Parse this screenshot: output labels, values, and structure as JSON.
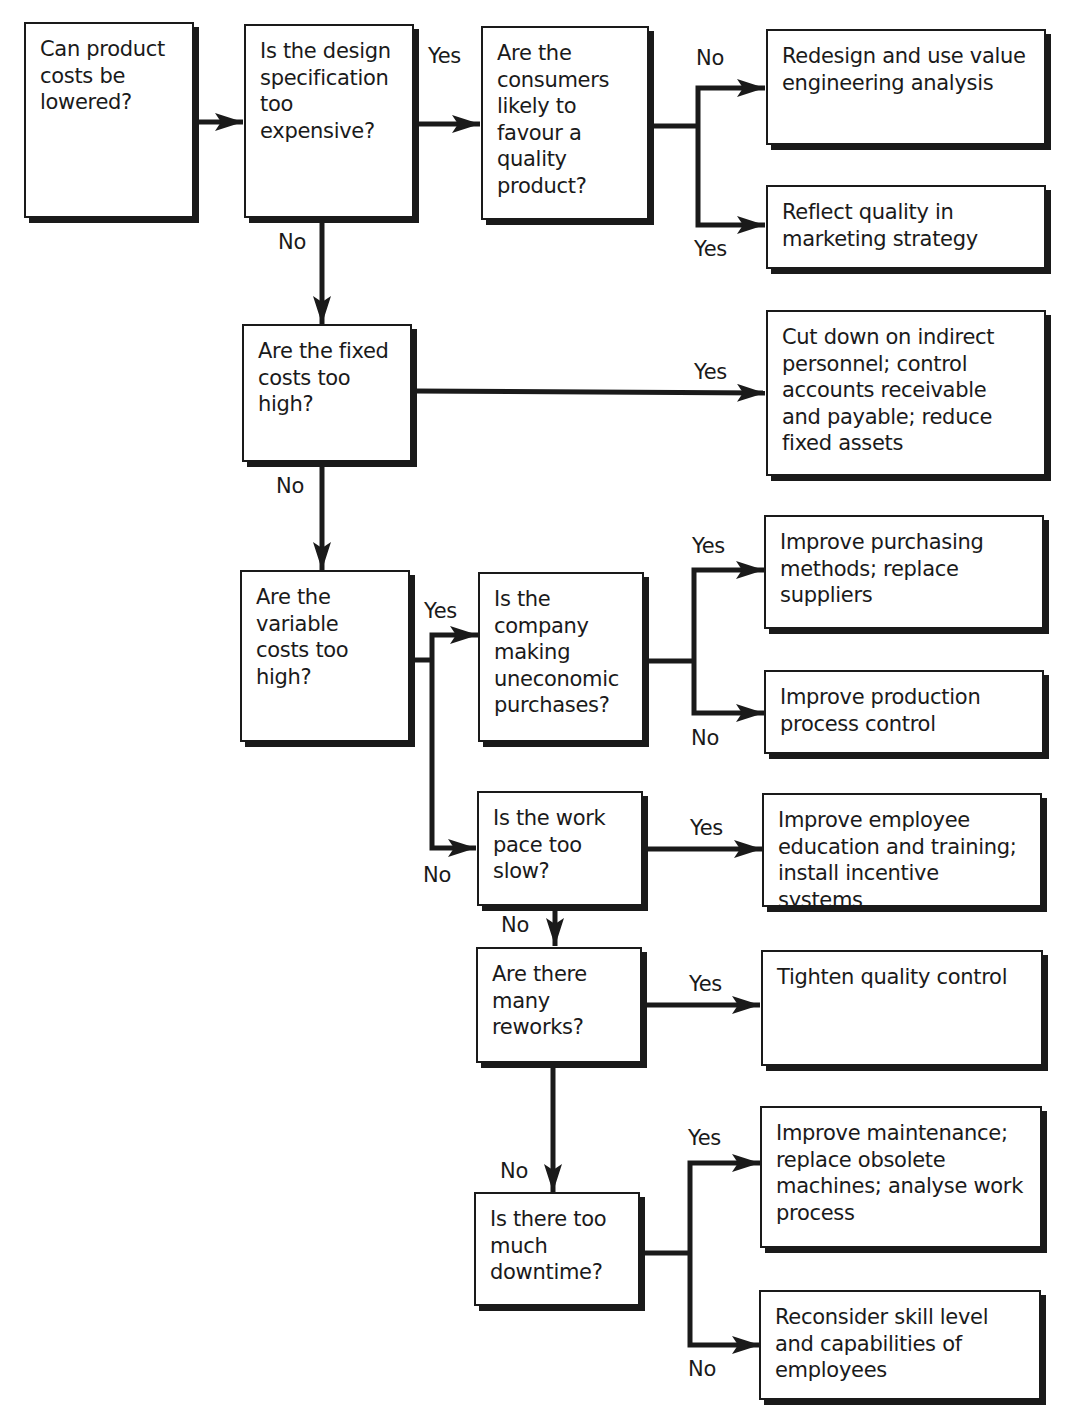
{
  "diagram": {
    "type": "flowchart",
    "nodes": {
      "q_costs_lowered": "Can product costs be lowered?",
      "q_design_spec": "Is the design specification too expensive?",
      "q_consumers_quality": "Are the consumers likely to favour a quality product?",
      "a_redesign": "Redesign and use value engineering analysis",
      "a_reflect_quality": "Reflect quality in marketing strategy",
      "q_fixed_costs": "Are the fixed costs too high?",
      "a_cut_down": "Cut down on indirect personnel; control accounts receivable and payable; reduce fixed assets",
      "q_variable_costs": "Are the variable costs too high?",
      "q_uneconomic_purchases": "Is the company making uneconomic purchases?",
      "a_improve_purchasing": "Improve purchasing methods; replace suppliers",
      "a_improve_production": "Improve production process control",
      "q_work_pace": "Is the work pace too slow?",
      "a_improve_education": "Improve employee education and training; install incentive systems",
      "q_reworks": "Are there many reworks?",
      "a_tighten_quality": "Tighten quality control",
      "q_downtime": "Is there too much downtime?",
      "a_improve_maintenance": "Improve maintenance; replace obsolete machines; analyse work process",
      "a_reconsider_skill": "Reconsider skill level and capabilities of employees"
    },
    "edge_labels": {
      "design_yes": "Yes",
      "design_no": "No",
      "consumers_no": "No",
      "consumers_yes": "Yes",
      "fixed_yes": "Yes",
      "fixed_no": "No",
      "variable_yes": "Yes",
      "variable_no": "No",
      "purchases_yes": "Yes",
      "purchases_no": "No",
      "workpace_yes": "Yes",
      "workpace_no": "No",
      "reworks_yes": "Yes",
      "reworks_no": "No",
      "downtime_yes": "Yes",
      "downtime_no": "No"
    },
    "edges": [
      {
        "from": "q_costs_lowered",
        "to": "q_design_spec",
        "label": ""
      },
      {
        "from": "q_design_spec",
        "to": "q_consumers_quality",
        "label": "Yes"
      },
      {
        "from": "q_design_spec",
        "to": "q_fixed_costs",
        "label": "No"
      },
      {
        "from": "q_consumers_quality",
        "to": "a_redesign",
        "label": "No"
      },
      {
        "from": "q_consumers_quality",
        "to": "a_reflect_quality",
        "label": "Yes"
      },
      {
        "from": "q_fixed_costs",
        "to": "a_cut_down",
        "label": "Yes"
      },
      {
        "from": "q_fixed_costs",
        "to": "q_variable_costs",
        "label": "No"
      },
      {
        "from": "q_variable_costs",
        "to": "q_uneconomic_purchases",
        "label": "Yes"
      },
      {
        "from": "q_variable_costs",
        "to": "q_work_pace",
        "label": "No"
      },
      {
        "from": "q_uneconomic_purchases",
        "to": "a_improve_purchasing",
        "label": "Yes"
      },
      {
        "from": "q_uneconomic_purchases",
        "to": "a_improve_production",
        "label": "No"
      },
      {
        "from": "q_work_pace",
        "to": "a_improve_education",
        "label": "Yes"
      },
      {
        "from": "q_work_pace",
        "to": "q_reworks",
        "label": "No"
      },
      {
        "from": "q_reworks",
        "to": "a_tighten_quality",
        "label": "Yes"
      },
      {
        "from": "q_reworks",
        "to": "q_downtime",
        "label": "No"
      },
      {
        "from": "q_downtime",
        "to": "a_improve_maintenance",
        "label": "Yes"
      },
      {
        "from": "q_downtime",
        "to": "a_reconsider_skill",
        "label": "No"
      }
    ],
    "colors": {
      "line": "#1a1a1a",
      "box_fill": "#ffffff",
      "background": "#ffffff"
    }
  }
}
